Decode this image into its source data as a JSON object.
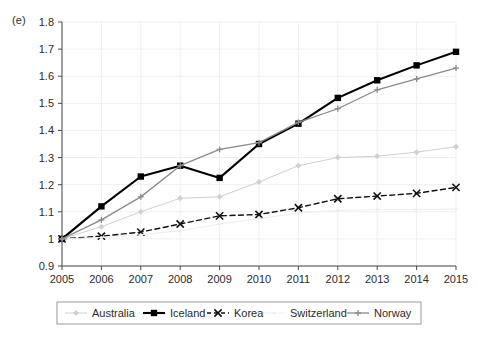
{
  "panel": {
    "label": "(e)"
  },
  "chart_data": {
    "type": "line",
    "title": "",
    "subtitle": "",
    "xlabel": "",
    "ylabel": "",
    "categories": [
      "2005",
      "2006",
      "2007",
      "2008",
      "2009",
      "2010",
      "2011",
      "2012",
      "2013",
      "2014",
      "2015"
    ],
    "x": [
      2005,
      2006,
      2007,
      2008,
      2009,
      2010,
      2011,
      2012,
      2013,
      2014,
      2015
    ],
    "ylim": [
      0.9,
      1.8
    ],
    "yticks": [
      0.9,
      1.0,
      1.1,
      1.2,
      1.3,
      1.4,
      1.5,
      1.6,
      1.7,
      1.8
    ],
    "ytick_labels": [
      "0.9",
      "1",
      "1.1",
      "1.2",
      "1.3",
      "1.4",
      "1.5",
      "1.6",
      "1.7",
      "1.8"
    ],
    "xticks": [
      2005,
      2006,
      2007,
      2008,
      2009,
      2010,
      2011,
      2012,
      2013,
      2014,
      2015
    ],
    "xtick_labels": [
      "2005",
      "2006",
      "2007",
      "2008",
      "2009",
      "2010",
      "2011",
      "2012",
      "2013",
      "2014",
      "2015"
    ],
    "grid": true,
    "legend_position": "bottom",
    "series": [
      {
        "name": "Australia",
        "color": "#d0d0d0",
        "marker": "diamond",
        "dash": "none",
        "width": 1,
        "values": [
          1.0,
          1.045,
          1.1,
          1.15,
          1.155,
          1.21,
          1.27,
          1.3,
          1.305,
          1.32,
          1.34
        ]
      },
      {
        "name": "Iceland",
        "color": "#000000",
        "marker": "square",
        "dash": "none",
        "width": 2.1,
        "values": [
          1.0,
          1.12,
          1.23,
          1.27,
          1.225,
          1.35,
          1.425,
          1.52,
          1.585,
          1.64,
          1.69
        ]
      },
      {
        "name": "Korea",
        "color": "#111111",
        "marker": "cross-x",
        "dash": "dashed",
        "width": 1.4,
        "values": [
          1.0,
          1.01,
          1.025,
          1.055,
          1.085,
          1.09,
          1.115,
          1.148,
          1.158,
          1.168,
          1.19
        ]
      },
      {
        "name": "Switzerland",
        "color": "#ededed",
        "marker": "dot",
        "dash": "none",
        "width": 1,
        "values": [
          1.0,
          1.005,
          1.015,
          1.03,
          1.055,
          1.075,
          1.095,
          1.105,
          1.108,
          1.108,
          1.11
        ]
      },
      {
        "name": "Norway",
        "color": "#8a8a8a",
        "marker": "plus",
        "dash": "none",
        "width": 1.3,
        "values": [
          1.0,
          1.07,
          1.155,
          1.27,
          1.33,
          1.355,
          1.43,
          1.48,
          1.55,
          1.59,
          1.63
        ]
      }
    ]
  },
  "legend": {
    "items": [
      {
        "label": "Australia"
      },
      {
        "label": "Iceland"
      },
      {
        "label": "Korea"
      },
      {
        "label": "Switzerland"
      },
      {
        "label": "Norway"
      }
    ]
  },
  "colors": {
    "axis": "#4a4a4a",
    "grid": "#efefef",
    "legend_border": "#9a9a9a",
    "background": "#ffffff"
  }
}
